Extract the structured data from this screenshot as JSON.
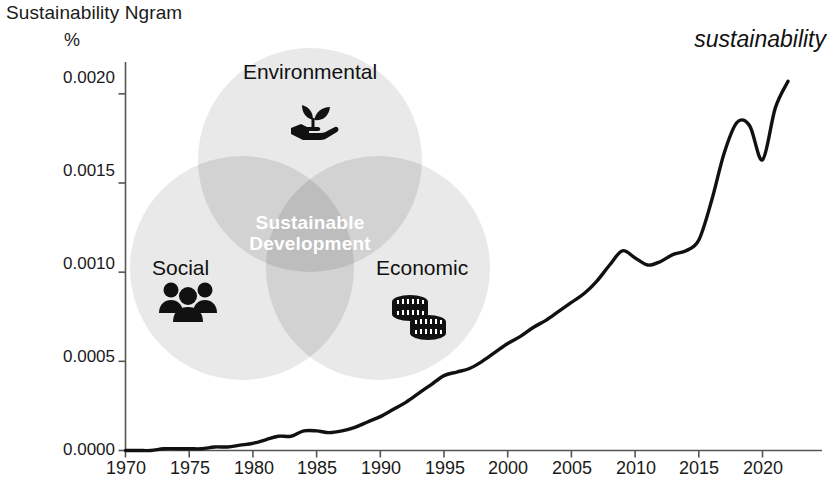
{
  "chart_title": "Sustainability Ngram",
  "series_annotation": "sustainability",
  "y_axis_unit": "%",
  "axes": {
    "y_ticks": [
      "0.0000",
      "0.0005",
      "0.0010",
      "0.0015",
      "0.0020"
    ],
    "x_ticks": [
      "1970",
      "1975",
      "1980",
      "1985",
      "1990",
      "1995",
      "2000",
      "2005",
      "2010",
      "2015",
      "2020"
    ]
  },
  "venn": {
    "top_label": "Environmental",
    "left_label": "Social",
    "right_label": "Economic",
    "center_label_line1": "Sustainable",
    "center_label_line2": "Development",
    "icons": {
      "top": "hand-holding-plant-icon",
      "left": "three-people-icon",
      "right": "stacked-coins-icon"
    },
    "colors": {
      "circle": "#e9e9e9",
      "pair_overlap": "#d2d2d2",
      "center_overlap": "#bdbdbd",
      "center_text": "#ffffff"
    }
  },
  "colors": {
    "line": "#111111",
    "axis": "#555555",
    "text": "#1a1a1a",
    "background": "#ffffff"
  },
  "chart_data": {
    "type": "line",
    "title": "Sustainability Ngram",
    "xlabel": "",
    "ylabel": "%",
    "xlim": [
      1970,
      2022
    ],
    "ylim": [
      0.0,
      0.0021
    ],
    "grid": false,
    "legend": "none",
    "annotations": [
      {
        "text": "sustainability",
        "x": 2019,
        "y": 0.00215,
        "style": "italic"
      }
    ],
    "series": [
      {
        "name": "sustainability",
        "x": [
          1970,
          1971,
          1972,
          1973,
          1974,
          1975,
          1976,
          1977,
          1978,
          1979,
          1980,
          1981,
          1982,
          1983,
          1984,
          1985,
          1986,
          1987,
          1988,
          1989,
          1990,
          1991,
          1992,
          1993,
          1994,
          1995,
          1996,
          1997,
          1998,
          1999,
          2000,
          2001,
          2002,
          2003,
          2004,
          2005,
          2006,
          2007,
          2008,
          2009,
          2010,
          2011,
          2012,
          2013,
          2014,
          2015,
          2016,
          2017,
          2018,
          2019,
          2020,
          2021,
          2022
        ],
        "values": [
          0.0,
          0.0,
          0.0,
          1e-05,
          1e-05,
          1e-05,
          1e-05,
          2e-05,
          2e-05,
          3e-05,
          4e-05,
          6e-05,
          8e-05,
          8e-05,
          0.00011,
          0.00011,
          0.0001,
          0.00011,
          0.00013,
          0.00016,
          0.00019,
          0.00023,
          0.00027,
          0.00032,
          0.00037,
          0.00042,
          0.00044,
          0.00046,
          0.0005,
          0.00055,
          0.0006,
          0.00064,
          0.00069,
          0.00073,
          0.00078,
          0.00083,
          0.00088,
          0.00095,
          0.00104,
          0.00112,
          0.00108,
          0.00104,
          0.00106,
          0.0011,
          0.00112,
          0.00118,
          0.0014,
          0.00167,
          0.00184,
          0.00182,
          0.00163,
          0.00192,
          0.00207
        ]
      }
    ]
  }
}
